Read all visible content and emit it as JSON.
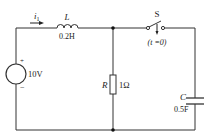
{
  "circuit": {
    "current_label": "i",
    "current_subscript": "1",
    "inductor": {
      "name": "L",
      "value": "0.2H"
    },
    "switch": {
      "name": "S",
      "timing": "(t =0)"
    },
    "source": {
      "value": "10V",
      "plus": "+",
      "minus": "−"
    },
    "resistor": {
      "name": "R",
      "value": "1Ω"
    },
    "capacitor": {
      "name": "C",
      "value": "0.5F"
    }
  }
}
